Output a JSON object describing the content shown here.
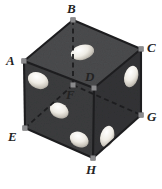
{
  "figure": {
    "object": "cube",
    "background_color": "#ffffff",
    "face_fill_top": "#4b4c4e",
    "face_fill_left": "#3c3d3f",
    "face_fill_right": "#333436",
    "edge_color_visible": "#1d1d1f",
    "edge_color_hidden": "#1d1d1f",
    "hidden_edge_style": "dashed",
    "pip_color": "#ece9e2",
    "pip_shadow_color": "#b9b5ad",
    "vertex_marker_color": "#8a8a8c",
    "label_color": "#232323"
  },
  "vertices": [
    {
      "id": "A",
      "label": "A",
      "x": 24,
      "y": 61,
      "label_x": 6,
      "label_y": 54,
      "hidden": false
    },
    {
      "id": "B",
      "label": "B",
      "x": 73,
      "y": 20,
      "label_x": 67,
      "label_y": 2,
      "hidden": false
    },
    {
      "id": "C",
      "label": "C",
      "x": 141,
      "y": 49,
      "label_x": 147,
      "label_y": 41,
      "hidden": false
    },
    {
      "id": "D",
      "label": "D",
      "x": 94,
      "y": 88,
      "label_x": 85,
      "label_y": 70,
      "hidden": false
    },
    {
      "id": "E",
      "label": "E",
      "x": 25,
      "y": 128,
      "label_x": 8,
      "label_y": 130,
      "hidden": false
    },
    {
      "id": "F",
      "label": "F",
      "x": 73,
      "y": 85,
      "label_x": 66,
      "label_y": 88,
      "hidden": true
    },
    {
      "id": "G",
      "label": "G",
      "x": 141,
      "y": 115,
      "label_x": 147,
      "label_y": 110,
      "hidden": false
    },
    {
      "id": "H",
      "label": "H",
      "x": 93,
      "y": 158,
      "label_x": 86,
      "label_y": 163,
      "hidden": false
    }
  ],
  "edges": [
    {
      "id": "A-B",
      "from": "A",
      "to": "B",
      "hidden": false
    },
    {
      "id": "B-C",
      "from": "B",
      "to": "C",
      "hidden": false
    },
    {
      "id": "C-D",
      "from": "C",
      "to": "D",
      "hidden": false
    },
    {
      "id": "D-A",
      "from": "D",
      "to": "A",
      "hidden": false
    },
    {
      "id": "A-E",
      "from": "A",
      "to": "E",
      "hidden": false
    },
    {
      "id": "C-G",
      "from": "C",
      "to": "G",
      "hidden": false
    },
    {
      "id": "D-H",
      "from": "D",
      "to": "H",
      "hidden": false
    },
    {
      "id": "B-F",
      "from": "B",
      "to": "F",
      "hidden": true
    },
    {
      "id": "E-F",
      "from": "E",
      "to": "F",
      "hidden": true
    },
    {
      "id": "F-G",
      "from": "F",
      "to": "G",
      "hidden": true
    },
    {
      "id": "E-H",
      "from": "E",
      "to": "H",
      "hidden": false
    },
    {
      "id": "H-G",
      "from": "H",
      "to": "G",
      "hidden": false
    }
  ],
  "faces": [
    {
      "id": "top",
      "name": "face-top-ABCD",
      "vertices": [
        "A",
        "B",
        "C",
        "D"
      ],
      "fill": "#4b4c4e",
      "pip_count": 1
    },
    {
      "id": "left",
      "name": "face-left-ADHE",
      "vertices": [
        "A",
        "D",
        "H",
        "E"
      ],
      "fill": "#3c3d3f",
      "pip_count": 3
    },
    {
      "id": "right",
      "name": "face-right-DCGH",
      "vertices": [
        "D",
        "C",
        "G",
        "H"
      ],
      "fill": "#333436",
      "pip_count": 2
    }
  ],
  "pips": [
    {
      "face": "top",
      "index": 1,
      "cx": 82,
      "cy": 52,
      "rx": 11.5,
      "ry": 7.0,
      "rotation": -18
    },
    {
      "face": "left",
      "index": 1,
      "cx": 38,
      "cy": 80,
      "rx": 10.5,
      "ry": 7.5,
      "rotation": 22
    },
    {
      "face": "left",
      "index": 2,
      "cx": 59,
      "cy": 110,
      "rx": 9.5,
      "ry": 7.0,
      "rotation": 22
    },
    {
      "face": "left",
      "index": 3,
      "cx": 79,
      "cy": 139,
      "rx": 9.5,
      "ry": 7.0,
      "rotation": 22
    },
    {
      "face": "right",
      "index": 1,
      "cx": 131,
      "cy": 76,
      "rx": 6.5,
      "ry": 10.5,
      "rotation": 18
    },
    {
      "face": "right",
      "index": 2,
      "cx": 107,
      "cy": 136,
      "rx": 6.5,
      "ry": 10.5,
      "rotation": 18
    }
  ]
}
